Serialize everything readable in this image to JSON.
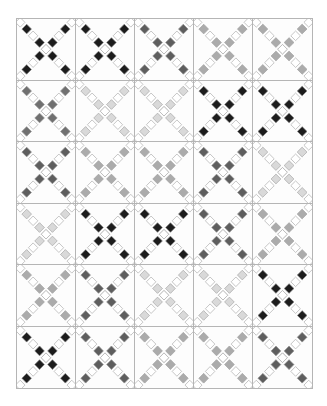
{
  "quilt": {
    "pattern": "double-irish-chain-x",
    "columns": 5,
    "rows": 6,
    "outline_color": "#b0b0b0",
    "background_color": "#fdfdfd",
    "shades": {
      "black": "#1c1c1c",
      "dark": "#5e5e5e",
      "medium": "#707070",
      "light": "#ababab",
      "very_light": "#d9d9d9"
    },
    "blocks": [
      [
        "black",
        "black",
        "dark",
        "light",
        "light"
      ],
      [
        "medium",
        "very_light",
        "very_light",
        "black",
        "black"
      ],
      [
        "dark",
        "light",
        "light",
        "dark",
        "very_light"
      ],
      [
        "very_light",
        "black",
        "black",
        "dark",
        "light"
      ],
      [
        "light",
        "dark",
        "very_light",
        "very_light",
        "black"
      ],
      [
        "black",
        "dark",
        "light",
        "light",
        "dark"
      ]
    ]
  }
}
